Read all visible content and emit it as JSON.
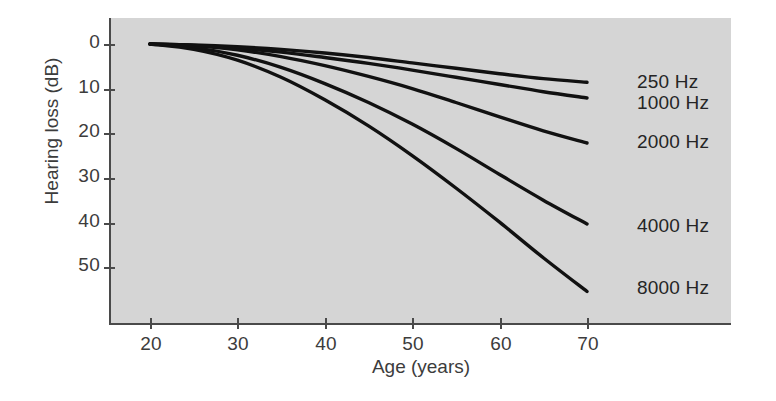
{
  "chart_data": {
    "type": "line",
    "title": "",
    "xlabel": "Age (years)",
    "ylabel": "Hearing loss (dB)",
    "xlim": [
      15,
      78
    ],
    "ylim": [
      58,
      -3
    ],
    "y_axis_inverted": true,
    "grid": false,
    "legend_position": "right-of-line-ends",
    "x_ticks": [
      20,
      30,
      40,
      50,
      60,
      70
    ],
    "y_ticks": [
      0,
      10,
      20,
      30,
      40,
      50
    ],
    "x": [
      20,
      25,
      30,
      35,
      40,
      45,
      50,
      55,
      60,
      65,
      70
    ],
    "series": [
      {
        "name": "250 Hz",
        "label": "250 Hz",
        "values": [
          0,
          0.2,
          0.6,
          1.2,
          2.0,
          3.0,
          4.2,
          5.4,
          6.6,
          7.7,
          8.5
        ]
      },
      {
        "name": "1000 Hz",
        "label": "1000 Hz",
        "values": [
          0,
          0.3,
          0.9,
          1.8,
          3.0,
          4.3,
          5.8,
          7.4,
          9.0,
          10.6,
          12.0
        ]
      },
      {
        "name": "2000 Hz",
        "label": "2000 Hz",
        "values": [
          0,
          0.4,
          1.3,
          2.8,
          4.8,
          7.2,
          9.9,
          13.0,
          16.2,
          19.3,
          22.0
        ]
      },
      {
        "name": "4000 Hz",
        "label": "4000 Hz",
        "values": [
          0,
          0.8,
          2.5,
          5.2,
          8.8,
          13.0,
          17.8,
          23.2,
          29.0,
          34.7,
          40.0
        ]
      },
      {
        "name": "8000 Hz",
        "label": "8000 Hz",
        "values": [
          0,
          1.2,
          3.6,
          7.4,
          12.4,
          18.2,
          24.8,
          32.0,
          39.6,
          47.5,
          55.0
        ]
      }
    ],
    "colors": {
      "panel_background": "#d5d5d5",
      "line": "#111111",
      "axis": "#4a4a4a",
      "text": "#3c3c3c"
    }
  },
  "axes": {
    "y_title": "Hearing loss (dB)",
    "x_title": "Age (years)",
    "y_tick_labels": [
      "0",
      "10",
      "20",
      "30",
      "40",
      "50"
    ],
    "x_tick_labels": [
      "20",
      "30",
      "40",
      "50",
      "60",
      "70"
    ]
  },
  "series_labels": {
    "s0": "250 Hz",
    "s1": "1000 Hz",
    "s2": "2000 Hz",
    "s3": "4000 Hz",
    "s4": "8000 Hz"
  }
}
